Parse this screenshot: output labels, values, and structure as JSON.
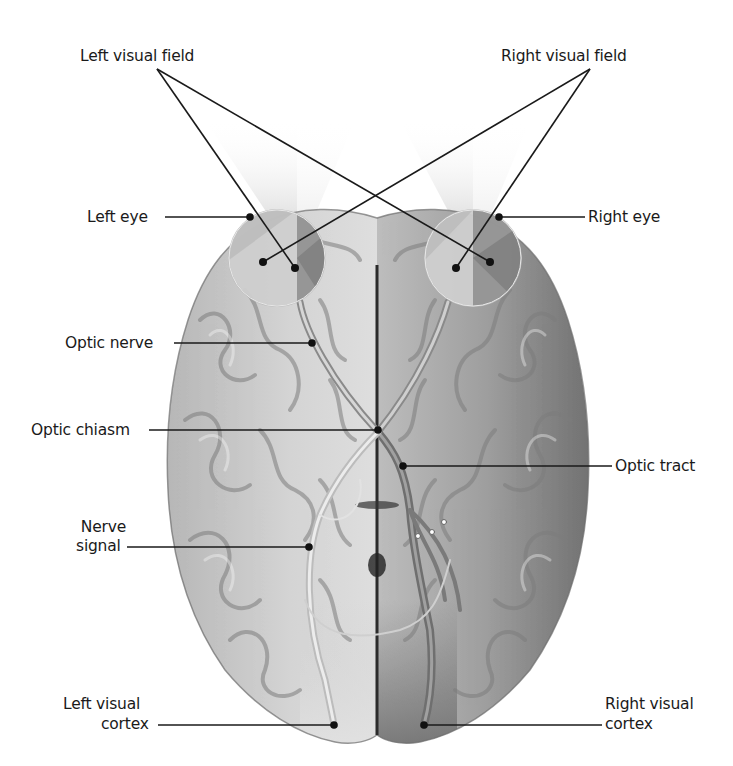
{
  "figure": {
    "labels": {
      "left_visual_field": "Left visual field",
      "right_visual_field": "Right visual field",
      "left_eye": "Left eye",
      "right_eye": "Right eye",
      "optic_nerve": "Optic nerve",
      "optic_chiasm": "Optic chiasm",
      "optic_tract": "Optic tract",
      "nerve_signal_line1": "Nerve",
      "nerve_signal_line2": "signal",
      "left_visual_cortex_line1": "Left visual",
      "left_visual_cortex_line2": "cortex",
      "right_visual_cortex_line1": "Right visual",
      "right_visual_cortex_line2": "cortex"
    },
    "colors": {
      "background": "#ffffff",
      "text": "#1a1a1a",
      "leader_line": "#1a1a1a",
      "brain_left_hemisphere": "#c9c9c9",
      "brain_right_hemisphere": "#8f8f8f",
      "brain_sulci": "#7a7a7a",
      "left_field_shade": "#e6e6e6",
      "right_field_shade": "#9a9a9a",
      "midline": "#2b2b2b"
    }
  }
}
